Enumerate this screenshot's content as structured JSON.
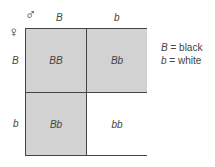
{
  "diagram": {
    "type": "punnett-square",
    "male_symbol": "♂",
    "female_symbol": "♀",
    "male_alleles": [
      "B",
      "b"
    ],
    "female_alleles": [
      "B",
      "b"
    ],
    "cells": [
      [
        {
          "genotype": "BB",
          "shaded": true
        },
        {
          "genotype": "Bb",
          "shaded": true
        }
      ],
      [
        {
          "genotype": "Bb",
          "shaded": true
        },
        {
          "genotype": "bb",
          "shaded": false
        }
      ]
    ],
    "legend": [
      {
        "allele": "B",
        "meaning": "= black"
      },
      {
        "allele": "b",
        "meaning": "= white"
      }
    ],
    "colors": {
      "shaded": "#d2d2d2",
      "unshaded": "#ffffff",
      "line": "#444444"
    }
  }
}
